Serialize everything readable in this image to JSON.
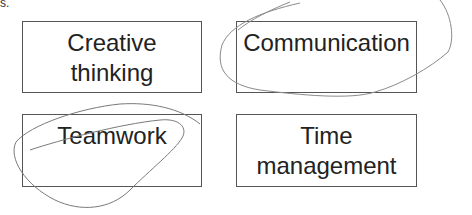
{
  "diagram": {
    "boxes": [
      {
        "label": "Creative thinking",
        "circled": false
      },
      {
        "label": "Communication",
        "circled": true
      },
      {
        "label": "Teamwork",
        "circled": true
      },
      {
        "label": "Time management",
        "circled": false
      }
    ],
    "annotations": [
      {
        "type": "hand-drawn-loop",
        "target": "Communication",
        "color": "#888888"
      },
      {
        "type": "hand-drawn-loop",
        "target": "Teamwork",
        "color": "#777777"
      }
    ],
    "fragment_text": "s."
  }
}
